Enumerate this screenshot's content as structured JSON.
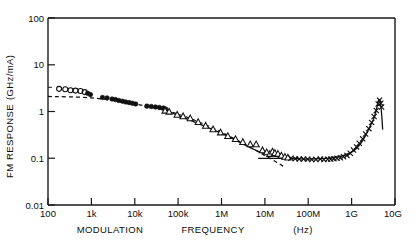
{
  "chart_data": {
    "type": "scatter",
    "title": "",
    "xlabel": "MODULATION   FREQUENCY   (Hz)",
    "ylabel": "FM  RESPONSE  (GHz/mA)",
    "xscale": "log",
    "yscale": "log",
    "xlim": [
      100,
      10000000000
    ],
    "ylim": [
      0.01,
      100
    ],
    "grid": false,
    "legend": "none",
    "xticklabels": [
      "100",
      "1k",
      "10k",
      "100k",
      "1M",
      "10M",
      "100M",
      "1G",
      "10G"
    ],
    "xtickvalues": [
      100,
      1000,
      10000,
      100000,
      1000000,
      10000000,
      100000000,
      1000000000,
      10000000000
    ],
    "yticklabels": [
      "100",
      "10",
      "1",
      "0.1",
      "0.01"
    ],
    "ytickvalues": [
      100,
      10,
      1,
      0.1,
      0.01
    ],
    "xlabel_parts": [
      "MODULATION",
      "FREQUENCY",
      "(Hz)"
    ],
    "ylabel_parts": [
      "FM",
      "RESPONSE",
      "(GHz/mA)"
    ],
    "series": [
      {
        "name": "open-circles",
        "marker": "open-circle",
        "points": [
          [
            180,
            3.05
          ],
          [
            250,
            3.0
          ],
          [
            330,
            2.85
          ],
          [
            430,
            2.8
          ],
          [
            560,
            2.75
          ],
          [
            700,
            2.6
          ]
        ]
      },
      {
        "name": "filled-circles",
        "marker": "filled-circle",
        "points": [
          [
            820,
            2.45
          ],
          [
            950,
            2.3
          ],
          [
            1800,
            2.0
          ],
          [
            2300,
            1.95
          ],
          [
            3000,
            1.85
          ],
          [
            3600,
            1.8
          ],
          [
            4300,
            1.72
          ],
          [
            5200,
            1.66
          ],
          [
            6200,
            1.6
          ],
          [
            7400,
            1.55
          ],
          [
            8800,
            1.5
          ],
          [
            10500,
            1.45
          ],
          [
            19000,
            1.3
          ],
          [
            24000,
            1.28
          ],
          [
            30000,
            1.25
          ],
          [
            37000,
            1.22
          ],
          [
            46000,
            1.18
          ],
          [
            52000,
            1.12
          ]
        ]
      },
      {
        "name": "open-triangles",
        "marker": "open-triangle",
        "points": [
          [
            50000,
            1.05
          ],
          [
            62000,
            1.0
          ],
          [
            95000,
            0.86
          ],
          [
            130000,
            0.8
          ],
          [
            190000,
            0.72
          ],
          [
            290000,
            0.6
          ],
          [
            430000,
            0.5
          ],
          [
            640000,
            0.42
          ],
          [
            950000,
            0.36
          ],
          [
            1400000,
            0.3
          ],
          [
            2100000,
            0.26
          ],
          [
            3100000,
            0.225
          ],
          [
            4600000,
            0.2
          ],
          [
            6300000,
            0.2
          ],
          [
            8800000,
            0.15
          ],
          [
            11000000,
            0.135
          ],
          [
            13000000,
            0.125
          ],
          [
            15000000,
            0.14
          ],
          [
            17000000,
            0.13
          ],
          [
            20000000,
            0.125
          ],
          [
            24000000,
            0.115
          ],
          [
            29000000,
            0.108
          ],
          [
            34000000,
            0.104
          ]
        ]
      },
      {
        "name": "crosses",
        "marker": "cross",
        "points": [
          [
            40000000,
            0.1
          ],
          [
            50000000,
            0.098
          ],
          [
            62000000,
            0.096
          ],
          [
            78000000,
            0.096
          ],
          [
            97000000,
            0.095
          ],
          [
            120000000,
            0.094
          ],
          [
            150000000,
            0.094
          ],
          [
            190000000,
            0.096
          ],
          [
            230000000,
            0.094
          ],
          [
            280000000,
            0.095
          ],
          [
            330000000,
            0.096
          ],
          [
            390000000,
            0.098
          ],
          [
            460000000,
            0.1
          ],
          [
            550000000,
            0.102
          ],
          [
            650000000,
            0.108
          ],
          [
            780000000,
            0.115
          ],
          [
            930000000,
            0.128
          ],
          [
            1100000000,
            0.15
          ],
          [
            1300000000,
            0.175
          ],
          [
            1500000000,
            0.21
          ],
          [
            1800000000,
            0.26
          ],
          [
            2100000000,
            0.33
          ],
          [
            2500000000,
            0.43
          ],
          [
            2900000000,
            0.58
          ],
          [
            3300000000,
            0.78
          ],
          [
            3700000000,
            1.05
          ],
          [
            4100000000,
            1.45
          ],
          [
            4400000000,
            1.75
          ],
          [
            4700000000,
            1.5
          ],
          [
            4900000000,
            1.25
          ]
        ]
      }
    ],
    "annotations": [
      {
        "name": "dashed-theory-line",
        "style": "dashed",
        "points": [
          [
            100,
            2.1
          ],
          [
            1000,
            1.95
          ],
          [
            10000,
            1.45
          ],
          [
            100000,
            0.88
          ],
          [
            1000000,
            0.36
          ],
          [
            10000000,
            0.115
          ],
          [
            30000000,
            0.063
          ]
        ]
      },
      {
        "name": "flat-theory-line",
        "style": "solid-horizontal",
        "points": [
          [
            7000000,
            0.1
          ],
          [
            60000000,
            0.1
          ]
        ]
      },
      {
        "name": "model-fit-curve",
        "style": "solid",
        "points": [
          [
            60000,
            1.0
          ],
          [
            1000000,
            0.34
          ],
          [
            10000000,
            0.125
          ],
          [
            100000000,
            0.096
          ],
          [
            1000000000,
            0.135
          ],
          [
            3000000000,
            0.6
          ],
          [
            4400000000,
            1.8
          ],
          [
            5200000000,
            0.42
          ]
        ]
      }
    ]
  }
}
